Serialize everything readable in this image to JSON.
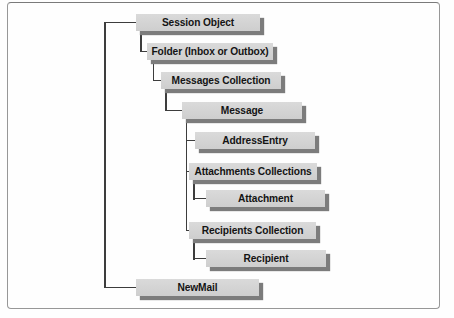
{
  "diagram": {
    "type": "tree",
    "nodes": [
      {
        "label": "Session Object",
        "level": 0,
        "parent": null
      },
      {
        "label": "Folder (Inbox or Outbox)",
        "level": 1,
        "parent": "Session Object"
      },
      {
        "label": "Messages Collection",
        "level": 2,
        "parent": "Folder (Inbox or Outbox)"
      },
      {
        "label": "Message",
        "level": 3,
        "parent": "Messages Collection"
      },
      {
        "label": "AddressEntry",
        "level": 4,
        "parent": "Message"
      },
      {
        "label": "Attachments Collections",
        "level": 4,
        "parent": "Message"
      },
      {
        "label": "Attachment",
        "level": 5,
        "parent": "Attachments Collections"
      },
      {
        "label": "Recipients Collection",
        "level": 4,
        "parent": "Message"
      },
      {
        "label": "Recipient",
        "level": 5,
        "parent": "Recipients Collection"
      },
      {
        "label": "NewMail",
        "level": 1,
        "parent": "Session Object"
      }
    ],
    "colors": {
      "box_fill": "#d4d4d4",
      "box_shadow": "#7c7c7c",
      "connector_line": "#3d3d3d",
      "text": "#141414",
      "frame_border": "#979797",
      "background": "#fefefe"
    }
  }
}
